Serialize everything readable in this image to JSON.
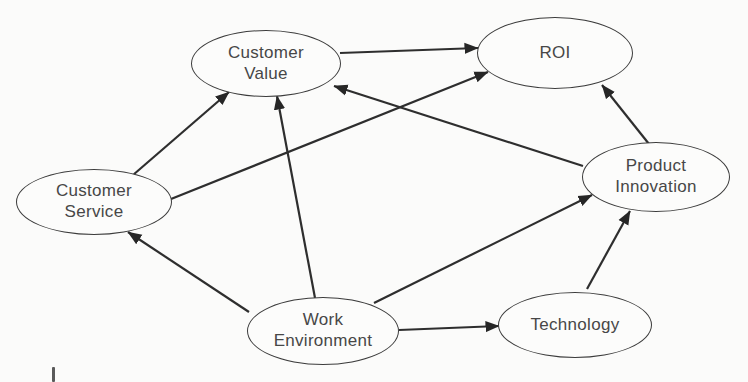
{
  "diagram": {
    "type": "causal-node-link-diagram",
    "nodes": {
      "customer_value": {
        "label": "Customer Value",
        "line1": "Customer",
        "line2": "Value"
      },
      "roi": {
        "label": "ROI",
        "line1": "ROI"
      },
      "customer_service": {
        "label": "Customer Service",
        "line1": "Customer",
        "line2": "Service"
      },
      "product_innovation": {
        "label": "Product Innovation",
        "line1": "Product",
        "line2": "Innovation"
      },
      "work_environment": {
        "label": "Work Environment",
        "line1": "Work",
        "line2": "Environment"
      },
      "technology": {
        "label": "Technology",
        "line1": "Technology"
      }
    },
    "edges": [
      {
        "from": "Customer Service",
        "to": "Customer Value"
      },
      {
        "from": "Customer Service",
        "to": "ROI"
      },
      {
        "from": "Customer Value",
        "to": "ROI"
      },
      {
        "from": "Product Innovation",
        "to": "ROI"
      },
      {
        "from": "Product Innovation",
        "to": "Customer Value"
      },
      {
        "from": "Work Environment",
        "to": "Customer Value"
      },
      {
        "from": "Work Environment",
        "to": "Customer Service"
      },
      {
        "from": "Work Environment",
        "to": "Product Innovation"
      },
      {
        "from": "Work Environment",
        "to": "Technology"
      },
      {
        "from": "Technology",
        "to": "Product Innovation"
      }
    ],
    "colors": {
      "background": "#fbfbfa",
      "line": "#2e2e2e",
      "arrowhead": "#262626",
      "node_border": "#3c3c3c",
      "node_fill": "#fcfcfb",
      "text": "#474747"
    }
  }
}
